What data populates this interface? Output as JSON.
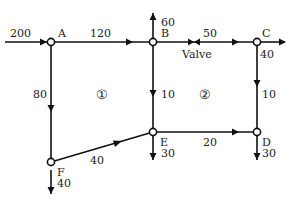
{
  "nodes": [
    {
      "id": "A",
      "label": "A",
      "x": 51,
      "y": 42
    },
    {
      "id": "B",
      "label": "B",
      "x": 153,
      "y": 42
    },
    {
      "id": "C",
      "label": "C",
      "x": 257,
      "y": 42
    },
    {
      "id": "D",
      "label": "D",
      "x": 257,
      "y": 132
    },
    {
      "id": "E",
      "label": "E",
      "x": 153,
      "y": 132
    },
    {
      "id": "F",
      "label": "F",
      "x": 51,
      "y": 162
    }
  ],
  "pipes": [
    {
      "from": "A",
      "to": "B",
      "flow": "120"
    },
    {
      "from": "B",
      "to": "C",
      "flow": "50"
    },
    {
      "from": "A",
      "to": "F",
      "flow": "80"
    },
    {
      "from": "B",
      "to": "E",
      "flow": "10"
    },
    {
      "from": "C",
      "to": "D",
      "flow": "10"
    },
    {
      "from": "F",
      "to": "E",
      "flow": "40"
    },
    {
      "from": "E",
      "to": "D",
      "flow": "20"
    }
  ],
  "external_flows": {
    "inflow_A": "200",
    "outflow_B": "60",
    "outflow_C": "40",
    "outflow_D": "30",
    "outflow_E": "30",
    "outflow_F": "40"
  },
  "valve": {
    "label": "Valve",
    "pipe": "B-C"
  },
  "loops": [
    {
      "label": "①"
    },
    {
      "label": "②"
    }
  ]
}
